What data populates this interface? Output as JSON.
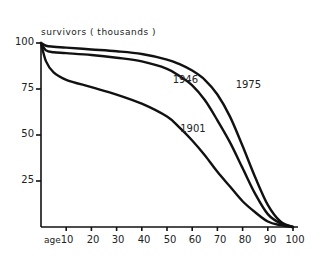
{
  "chart_data": {
    "type": "line",
    "title": "",
    "ylabel": "survivors ( thousands )",
    "xlabel": "age",
    "ylim": [
      0,
      100
    ],
    "xlim": [
      0,
      100
    ],
    "yticks": [
      "100",
      "75",
      "50",
      "25"
    ],
    "xticks": [
      "10",
      "20",
      "30",
      "40",
      "50",
      "60",
      "70",
      "80",
      "90",
      "100"
    ],
    "grid": false,
    "legend": "inline labels",
    "x": [
      0,
      2,
      5,
      10,
      20,
      30,
      40,
      50,
      55,
      60,
      65,
      70,
      75,
      80,
      85,
      90,
      95,
      100
    ],
    "series": [
      {
        "name": "1975",
        "values": [
          100,
          98.5,
          98,
          97.5,
          96.5,
          95.5,
          94,
          91,
          88.5,
          85,
          80,
          72,
          60,
          44,
          27,
          12,
          3,
          0
        ]
      },
      {
        "name": "1946",
        "values": [
          100,
          96,
          95,
          94.5,
          93.5,
          92,
          90,
          86,
          82,
          77,
          69,
          58,
          46,
          32,
          18,
          7,
          2,
          0
        ]
      },
      {
        "name": "1901",
        "values": [
          100,
          90,
          84,
          80,
          76,
          72,
          67,
          60,
          54,
          47,
          39,
          30,
          22,
          14,
          8,
          3,
          1,
          0
        ]
      }
    ],
    "annotations": [
      {
        "text": "1975",
        "x": 82,
        "y": 77
      },
      {
        "text": "1946",
        "x": 57,
        "y": 80
      },
      {
        "text": "1901",
        "x": 60,
        "y": 53
      }
    ]
  }
}
